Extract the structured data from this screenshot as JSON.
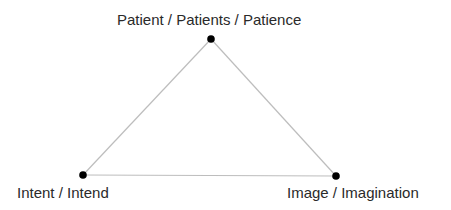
{
  "diagram": {
    "type": "triangle",
    "nodes": [
      {
        "id": "top",
        "label": "Patient / Patients / Patience",
        "x": 211,
        "y": 39
      },
      {
        "id": "left",
        "label": "Intent / Intend",
        "x": 83,
        "y": 175
      },
      {
        "id": "right",
        "label": "Image / Imagination",
        "x": 336,
        "y": 176
      }
    ],
    "edges": [
      [
        "top",
        "left"
      ],
      [
        "left",
        "right"
      ],
      [
        "right",
        "top"
      ]
    ],
    "colors": {
      "edge": "#bdbdbd",
      "node": "#000000",
      "text": "#2a2a2a"
    }
  }
}
